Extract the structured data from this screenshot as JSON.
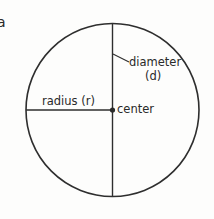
{
  "diagram": {
    "type": "circle-anatomy",
    "cropped_text": "a",
    "labels": {
      "radius": "radius (r)",
      "diameter_line1": "diameter",
      "diameter_line2": "(d)",
      "center": "center"
    },
    "colors": {
      "stroke": "#2e2e2e",
      "text": "#2a2a2a",
      "background": "#fdfdfc"
    }
  }
}
